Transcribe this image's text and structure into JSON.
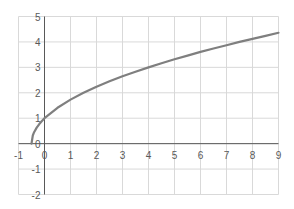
{
  "chart_data": {
    "type": "line",
    "title": "",
    "xlabel": "",
    "ylabel": "",
    "xlim": [
      -1,
      9
    ],
    "ylim": [
      -2,
      5
    ],
    "grid": true,
    "legend": null,
    "x_ticks": [
      -1,
      0,
      1,
      2,
      3,
      4,
      5,
      6,
      7,
      8,
      9
    ],
    "y_ticks": [
      -2,
      -1,
      0,
      1,
      2,
      3,
      4,
      5
    ],
    "series": [
      {
        "name": "y = sqrt(2x+1)",
        "color": "#7f7f7f",
        "x": [
          -0.5,
          -0.45,
          -0.4,
          -0.3,
          -0.2,
          -0.1,
          0,
          0.5,
          1,
          1.5,
          2,
          2.5,
          3,
          3.5,
          4,
          4.5,
          5,
          5.5,
          6,
          6.5,
          7,
          7.5,
          8,
          8.5,
          9
        ],
        "y": [
          0,
          0.32,
          0.45,
          0.63,
          0.77,
          0.89,
          1,
          1.41,
          1.73,
          2,
          2.24,
          2.45,
          2.65,
          2.83,
          3,
          3.16,
          3.32,
          3.46,
          3.61,
          3.74,
          3.87,
          4,
          4.12,
          4.24,
          4.36
        ]
      }
    ]
  },
  "colors": {
    "grid": "#d9d9d9",
    "axis": "#595959",
    "line": "#7f7f7f",
    "tick_text": "#595959"
  }
}
